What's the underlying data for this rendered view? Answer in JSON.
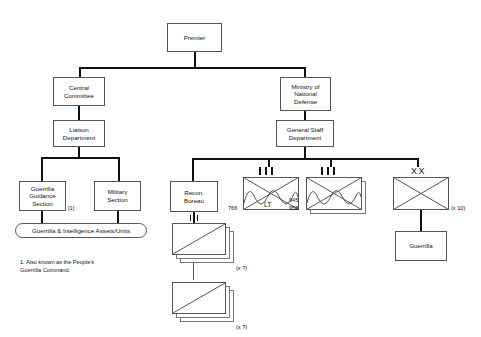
{
  "diagram": {
    "nodes": {
      "premier": "Premier",
      "central_committee": "Central\nCommittee",
      "ministry_defense": "Ministry of\nNational\nDefense",
      "liaison_department": "Liaison\nDepartment",
      "general_staff": "General Staff\nDepartment",
      "guerrilla_guidance": "Guerrilla\nGuidance\nSection",
      "military_section": "Military\nSection",
      "recon_bureau": "Recon.\nBureau",
      "guerrilla": "Guerrilla",
      "assets_oval": "Guerrilla & Intelligence Assets/Units"
    },
    "markers": {
      "footnote_ref": "[1]"
    },
    "units": [
      {
        "id": "unit-766-lt",
        "designation": "766",
        "inner_label": "LT",
        "echelon_ticks": 3,
        "stacked": false,
        "multiplier": ""
      },
      {
        "id": "unit-945-958",
        "designation": "945\n958",
        "inner_label": "",
        "echelon_ticks": 3,
        "stacked": true,
        "multiplier": ""
      },
      {
        "id": "unit-division-xx",
        "designation": "",
        "inner_label": "",
        "echelon_symbol": "XX",
        "echelon_ticks": 0,
        "stacked": false,
        "multiplier": "(x 10)"
      }
    ],
    "stacks": [
      {
        "id": "recon-stack-upper",
        "multiplier": "(x ?)",
        "ticks": 2
      },
      {
        "id": "recon-stack-lower",
        "multiplier": "(x ?)",
        "ticks": 1
      }
    ],
    "footnote": "1. Also known as the People's\nGuerrilla Command.",
    "colors": {
      "line": "#111111",
      "box_border": "#555555",
      "background": "#ffffff",
      "text": "#111111"
    }
  }
}
